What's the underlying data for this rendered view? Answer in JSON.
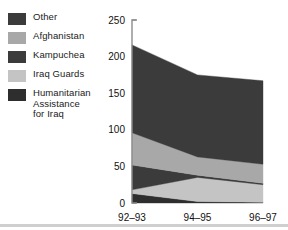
{
  "legend": {
    "position": "top-left",
    "items": [
      {
        "label": "Other",
        "color": "#3b3b3b"
      },
      {
        "label": "Afghanistan",
        "color": "#a8a8a8"
      },
      {
        "label": "Kampuchea",
        "color": "#3b3b3b"
      },
      {
        "label": "Iraq Guards",
        "color": "#c4c4c4"
      },
      {
        "label": "Humanitarian\nAssistance\nfor Iraq",
        "color": "#2e2e2e"
      }
    ]
  },
  "axes": {
    "y_ticks": [
      "0",
      "50",
      "100",
      "150",
      "200",
      "250"
    ],
    "x_ticks": [
      "92–93",
      "94–95",
      "96–97"
    ],
    "ylim": [
      0,
      250
    ],
    "grid": false,
    "axis_color": "#8c8c8c"
  },
  "chart_data": {
    "type": "area",
    "title": "",
    "xlabel": "",
    "ylabel": "",
    "ylim": [
      0,
      250
    ],
    "grid": false,
    "legend_position": "top-left",
    "stacked": true,
    "stack_order_bottom_to_top": [
      "Humanitarian Assistance for Iraq",
      "Iraq Guards",
      "Kampuchea",
      "Afghanistan",
      "Other"
    ],
    "categories": [
      "92–93",
      "94–95",
      "96–97"
    ],
    "x": [
      0,
      1,
      2
    ],
    "series": [
      {
        "name": "Humanitarian Assistance for Iraq",
        "color": "#2e2e2e",
        "values": [
          13,
          2,
          1
        ]
      },
      {
        "name": "Iraq Guards",
        "color": "#c4c4c4",
        "values": [
          5,
          33,
          24
        ]
      },
      {
        "name": "Kampuchea",
        "color": "#3b3b3b",
        "values": [
          34,
          3,
          2
        ]
      },
      {
        "name": "Afghanistan",
        "color": "#a8a8a8",
        "values": [
          44,
          25,
          26
        ]
      },
      {
        "name": "Other",
        "color": "#3b3b3b",
        "values": [
          120,
          112,
          114
        ]
      }
    ],
    "cumulative_tops": {
      "Humanitarian Assistance for Iraq": [
        13,
        2,
        1
      ],
      "Iraq Guards": [
        18,
        35,
        25
      ],
      "Kampuchea": [
        52,
        38,
        27
      ],
      "Afghanistan": [
        96,
        63,
        53
      ],
      "Other": [
        216,
        175,
        167
      ]
    },
    "totals": [
      216,
      175,
      167
    ]
  }
}
